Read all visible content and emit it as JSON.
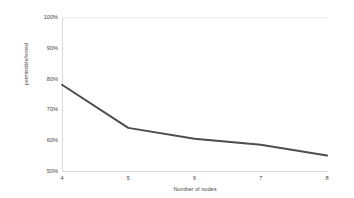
{
  "chart_data": {
    "type": "line",
    "title": "",
    "subtitle": "",
    "xlabel": "Number of nodes",
    "ylabel": "permissible/tested",
    "x": [
      4,
      5,
      6,
      7,
      8
    ],
    "categories": [
      "4",
      "5",
      "6",
      "7",
      "8"
    ],
    "values": [
      78,
      64,
      60.5,
      58.5,
      55
    ],
    "series": [
      {
        "name": "permissible/tested",
        "values": [
          78,
          64,
          60.5,
          58.5,
          55
        ]
      }
    ],
    "xtick_labels": [
      "4",
      "5",
      "6",
      "7",
      "8"
    ],
    "ytick_labels": [
      "100%",
      "90%",
      "80%",
      "70%",
      "60%",
      "50%"
    ],
    "ytick_values": [
      100,
      90,
      80,
      70,
      60,
      50
    ],
    "ylim": [
      50,
      100
    ],
    "xlim": [
      4,
      8
    ],
    "grid": "top-only",
    "legend": "none",
    "line_color": "#4d4d4d",
    "axis_color": "#d9d9d9",
    "gridline_color": "#ededed",
    "text_color": "#3f3f3f",
    "background_color": "#ffffff",
    "annotations": []
  }
}
